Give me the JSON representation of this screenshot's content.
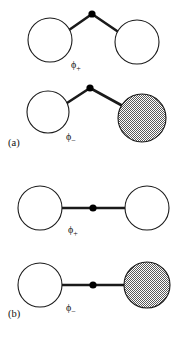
{
  "figure": {
    "width": 185,
    "height": 337,
    "background_color": "#ffffff",
    "stroke_color": "#1a1a1a",
    "circle_fill_empty": "#ffffff",
    "circle_fill_shaded": "#b3b3b3",
    "node_dot_color": "#000000"
  },
  "panels": [
    {
      "id": "panel-a",
      "label": "(a)",
      "geometry": "bent",
      "label_position": {
        "x": 8,
        "y": 146
      },
      "rows": [
        {
          "id": "panel-a-row-phi-plus",
          "orbital_label": "ϕ",
          "orbital_subscript": "+",
          "label_position": {
            "x": 71,
            "y": 68
          },
          "shaded_right": false,
          "lobes": [
            {
              "name": "left-lobe",
              "cx": 50,
              "cy": 40,
              "r": 22,
              "shaded": false
            },
            {
              "name": "right-lobe",
              "cx": 137,
              "cy": 42,
              "r": 22,
              "shaded": false
            }
          ],
          "center_node": {
            "cx": 92,
            "cy": 14,
            "r": 3.6
          },
          "bonds": [
            {
              "x1": 92,
              "y1": 14,
              "x2": 69,
              "y2": 30
            },
            {
              "x1": 92,
              "y1": 14,
              "x2": 117,
              "y2": 31
            }
          ]
        },
        {
          "id": "panel-a-row-phi-minus",
          "orbital_label": "ϕ",
          "orbital_subscript": "−",
          "label_position": {
            "x": 66,
            "y": 140
          },
          "shaded_right": true,
          "lobes": [
            {
              "name": "left-lobe",
              "cx": 48,
              "cy": 112,
              "r": 21,
              "shaded": false
            },
            {
              "name": "right-lobe",
              "cx": 142,
              "cy": 118,
              "r": 24,
              "shaded": true
            }
          ],
          "center_node": {
            "cx": 90,
            "cy": 88,
            "r": 3.6
          },
          "bonds": [
            {
              "x1": 90,
              "y1": 88,
              "x2": 67,
              "y2": 103
            },
            {
              "x1": 90,
              "y1": 88,
              "x2": 121,
              "y2": 105
            }
          ]
        }
      ]
    },
    {
      "id": "panel-b",
      "label": "(b)",
      "geometry": "linear",
      "label_position": {
        "x": 8,
        "y": 317
      },
      "rows": [
        {
          "id": "panel-b-row-phi-plus",
          "orbital_label": "ϕ",
          "orbital_subscript": "+",
          "label_position": {
            "x": 68,
            "y": 233
          },
          "shaded_right": false,
          "lobes": [
            {
              "name": "left-lobe",
              "cx": 40,
              "cy": 208,
              "r": 22,
              "shaded": false
            },
            {
              "name": "right-lobe",
              "cx": 147,
              "cy": 208,
              "r": 22,
              "shaded": false
            }
          ],
          "center_node": {
            "cx": 93,
            "cy": 208,
            "r": 3.6
          },
          "bonds": [
            {
              "x1": 62,
              "y1": 208,
              "x2": 125,
              "y2": 208
            }
          ]
        },
        {
          "id": "panel-b-row-phi-minus",
          "orbital_label": "ϕ",
          "orbital_subscript": "−",
          "label_position": {
            "x": 66,
            "y": 311
          },
          "shaded_right": true,
          "lobes": [
            {
              "name": "left-lobe",
              "cx": 40,
              "cy": 285,
              "r": 22,
              "shaded": false
            },
            {
              "name": "right-lobe",
              "cx": 147,
              "cy": 285,
              "r": 23,
              "shaded": true
            }
          ],
          "center_node": {
            "cx": 93,
            "cy": 285,
            "r": 3.6
          },
          "bonds": [
            {
              "x1": 62,
              "y1": 285,
              "x2": 124,
              "y2": 285
            }
          ]
        }
      ]
    }
  ],
  "chart_data": {
    "type": "diagram",
    "title": "",
    "panel_labels": [
      "(a)",
      "(b)"
    ],
    "orbital_labels": [
      "ϕ₊",
      "ϕ₋",
      "ϕ₊",
      "ϕ₋"
    ],
    "configurations": [
      {
        "panel": "(a)",
        "orbital": "ϕ₊",
        "geometry": "bent",
        "left_lobe_phase": "unshaded",
        "right_lobe_phase": "unshaded"
      },
      {
        "panel": "(a)",
        "orbital": "ϕ₋",
        "geometry": "bent",
        "left_lobe_phase": "unshaded",
        "right_lobe_phase": "shaded"
      },
      {
        "panel": "(b)",
        "orbital": "ϕ₊",
        "geometry": "linear",
        "left_lobe_phase": "unshaded",
        "right_lobe_phase": "unshaded"
      },
      {
        "panel": "(b)",
        "orbital": "ϕ₋",
        "geometry": "linear",
        "left_lobe_phase": "unshaded",
        "right_lobe_phase": "shaded"
      }
    ]
  }
}
